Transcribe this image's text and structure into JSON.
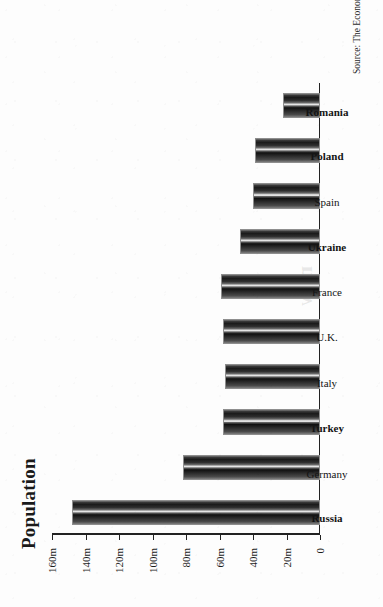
{
  "figure": {
    "title": "Population",
    "source": "Source: The Economist",
    "bleed_text": "new"
  },
  "chart_data": {
    "type": "bar",
    "orientation": "vertical-printed-rotated",
    "title": "Population",
    "xlabel": "",
    "ylabel": "",
    "ylim": [
      0,
      160
    ],
    "yunit": "m",
    "grid": false,
    "legend": null,
    "source": "Source: The Economist",
    "categories": [
      "Russia",
      "Germany",
      "Turkey",
      "Italy",
      "U.K.",
      "France",
      "Ukraine",
      "Spain",
      "Poland",
      "Romania"
    ],
    "values": [
      148,
      82,
      58,
      57,
      58,
      59,
      48,
      40,
      39,
      22
    ],
    "value_labels": [
      "148m",
      "82m",
      "58m",
      "57m",
      "58m",
      "59m",
      "48m",
      "40m",
      "39m",
      "22m"
    ],
    "bold_categories": [
      "Russia",
      "Turkey",
      "Ukraine",
      "Poland",
      "Romania"
    ],
    "ticks": [
      {
        "value": 160,
        "label": "160m"
      },
      {
        "value": 140,
        "label": "140m"
      },
      {
        "value": 120,
        "label": "120m"
      },
      {
        "value": 100,
        "label": "100m"
      },
      {
        "value": 80,
        "label": "80m"
      },
      {
        "value": 60,
        "label": "60m"
      },
      {
        "value": 40,
        "label": "40m"
      },
      {
        "value": 20,
        "label": "20m"
      },
      {
        "value": 0,
        "label": "0"
      }
    ]
  },
  "colors": {
    "ink": "#1a1a1a",
    "paper": "#fdfdfd",
    "bar_dark": "#141414",
    "bar_highlight": "#f2f2f2"
  }
}
